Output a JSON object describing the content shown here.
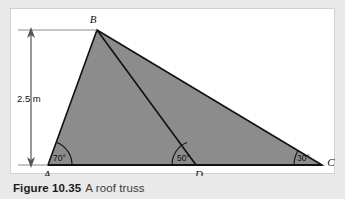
{
  "figure": {
    "caption_bold": "Figure 10.35",
    "caption_rest": "A roof truss",
    "vertices": {
      "A": "A",
      "B": "B",
      "C": "C",
      "D": "D"
    },
    "angles": {
      "at_A": "70°",
      "at_D": "50°",
      "at_C": "30°"
    },
    "dimension": {
      "height_label": "2.5 m"
    },
    "colors": {
      "fill": "#8c8c8c",
      "outline": "#111111",
      "panel_bg": "#ffffff",
      "page_bg": "#e9e9e9",
      "panel_border": "#d2d2d2",
      "dim_line": "#4a4a4a"
    }
  }
}
